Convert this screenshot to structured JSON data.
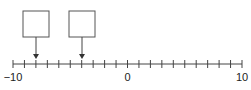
{
  "number_line": {
    "min": -10,
    "max": 10,
    "step": 1,
    "labels": [
      {
        "value": -10,
        "text": "−10"
      },
      {
        "value": 0,
        "text": "0"
      },
      {
        "value": 10,
        "text": "10"
      }
    ]
  },
  "answer_boxes": [
    {
      "points_to": -8,
      "value": ""
    },
    {
      "points_to": -4,
      "value": ""
    }
  ],
  "colors": {
    "line": "#444444",
    "box_border": "#555555",
    "text": "#222222"
  }
}
